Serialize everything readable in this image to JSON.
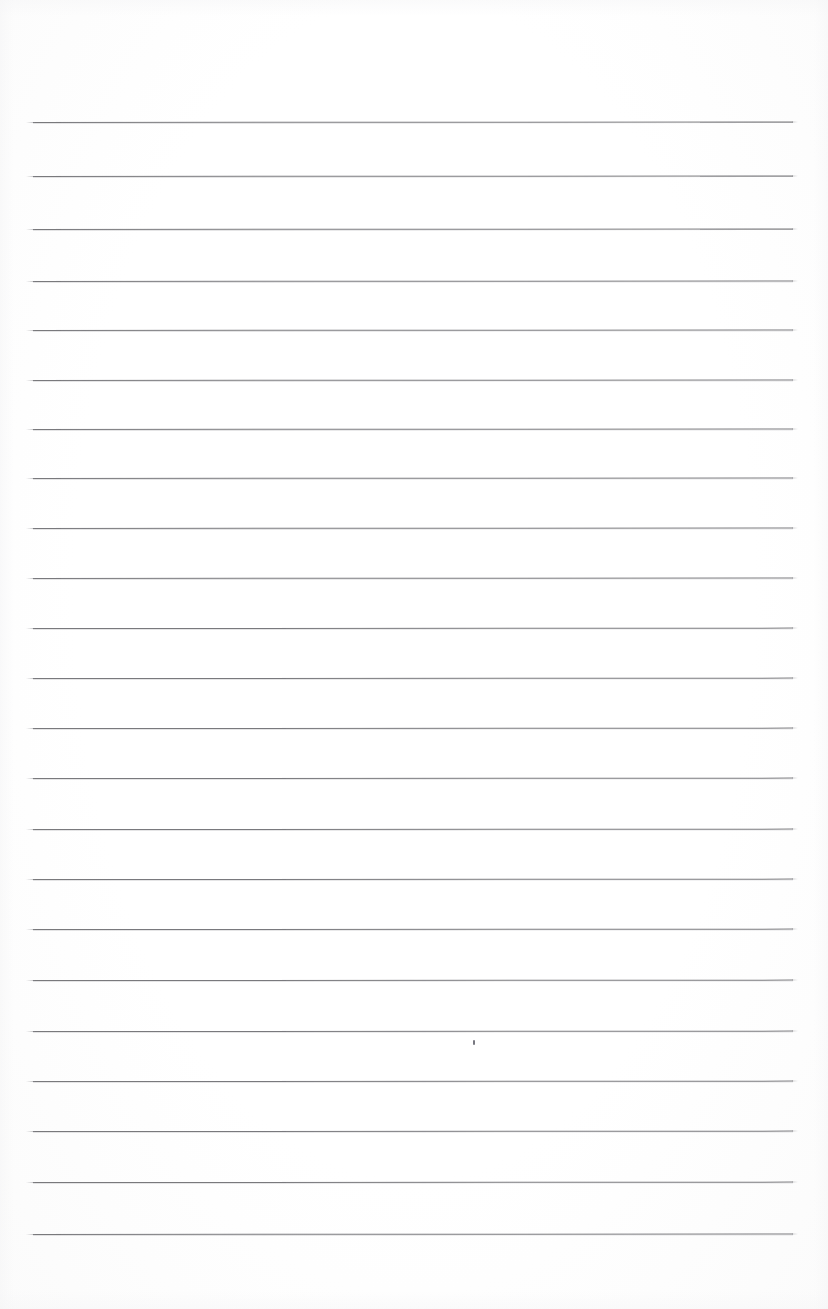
{
  "document": {
    "kind": "scanned-lined-notebook-page",
    "title": "Blank ruled notebook page",
    "page_width": 828,
    "page_height": 1309,
    "background_color": "#ffffff",
    "rule_color": "#6e6e72",
    "text_content": "",
    "visible_text": []
  },
  "ruling": {
    "line_count": 23,
    "left_x": 33,
    "right_x": 793,
    "line_length": 760,
    "first_line_y": 122,
    "last_line_y": 1234,
    "average_spacing": 50.5,
    "thickness_px": 1,
    "lines": [
      {
        "index": 1,
        "y": 122,
        "left": 33,
        "right": 793,
        "slope": -0.6
      },
      {
        "index": 2,
        "y": 176,
        "left": 33,
        "right": 793,
        "slope": -0.6
      },
      {
        "index": 3,
        "y": 229,
        "left": 33,
        "right": 793,
        "slope": -0.6
      },
      {
        "index": 4,
        "y": 281,
        "left": 33,
        "right": 793,
        "slope": -0.5
      },
      {
        "index": 5,
        "y": 330,
        "left": 33,
        "right": 793,
        "slope": -0.5
      },
      {
        "index": 6,
        "y": 380,
        "left": 33,
        "right": 793,
        "slope": -0.5
      },
      {
        "index": 7,
        "y": 429,
        "left": 33,
        "right": 793,
        "slope": -0.5
      },
      {
        "index": 8,
        "y": 478,
        "left": 33,
        "right": 793,
        "slope": -0.5
      },
      {
        "index": 9,
        "y": 528,
        "left": 33,
        "right": 793,
        "slope": -0.5
      },
      {
        "index": 10,
        "y": 578,
        "left": 33,
        "right": 793,
        "slope": -0.5
      },
      {
        "index": 11,
        "y": 628,
        "left": 33,
        "right": 793,
        "slope": -0.4
      },
      {
        "index": 12,
        "y": 678,
        "left": 33,
        "right": 793,
        "slope": -0.4
      },
      {
        "index": 13,
        "y": 728,
        "left": 33,
        "right": 793,
        "slope": -0.4
      },
      {
        "index": 14,
        "y": 778,
        "left": 33,
        "right": 793,
        "slope": -0.4
      },
      {
        "index": 15,
        "y": 829,
        "left": 33,
        "right": 793,
        "slope": -0.4
      },
      {
        "index": 16,
        "y": 879,
        "left": 33,
        "right": 793,
        "slope": -0.4
      },
      {
        "index": 17,
        "y": 929,
        "left": 33,
        "right": 793,
        "slope": -0.4
      },
      {
        "index": 18,
        "y": 980,
        "left": 33,
        "right": 793,
        "slope": -0.4
      },
      {
        "index": 19,
        "y": 1031,
        "left": 33,
        "right": 793,
        "slope": -0.4
      },
      {
        "index": 20,
        "y": 1081,
        "left": 33,
        "right": 793,
        "slope": -0.4
      },
      {
        "index": 21,
        "y": 1131,
        "left": 33,
        "right": 793,
        "slope": -0.4
      },
      {
        "index": 22,
        "y": 1182,
        "left": 33,
        "right": 793,
        "slope": -0.4
      },
      {
        "index": 23,
        "y": 1234,
        "left": 33,
        "right": 793,
        "slope": -0.5
      }
    ]
  },
  "marks": [
    {
      "name": "stray-pencil-dot",
      "x": 473,
      "y": 1040,
      "width": 2,
      "height": 5,
      "color": "#787880"
    }
  ],
  "margins": {
    "top_blank_height": 122,
    "bottom_blank_height": 75,
    "left_margin": 33,
    "right_margin": 35
  }
}
